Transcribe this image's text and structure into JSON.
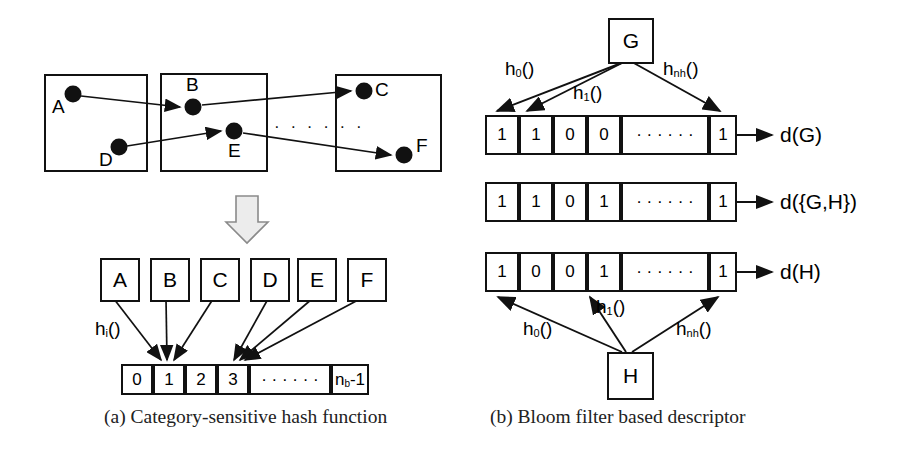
{
  "figure": {
    "panels": [
      {
        "id": "a",
        "caption": "(a) Category-sensitive hash function",
        "groups": [
          {
            "name": "group-1",
            "nodes": [
              "A",
              "D"
            ]
          },
          {
            "name": "group-2",
            "nodes": [
              "B",
              "E"
            ]
          },
          {
            "name": "group-3",
            "nodes": [
              "C",
              "F"
            ]
          }
        ],
        "ellipsis": "· · · · · ·",
        "item_boxes": [
          "A",
          "B",
          "C",
          "D",
          "E",
          "F"
        ],
        "hash_label": "h",
        "hash_sub": "i",
        "hash_suffix": "()",
        "bit_cells": [
          "0",
          "1",
          "2",
          "3",
          "· · · · · ·",
          "n"
        ],
        "last_cell_label": "n",
        "last_cell_sub": "b",
        "last_cell_suffix": "-1",
        "cell_ellipsis": "· · · · · ·",
        "mapping_note": [
          "A→1",
          "B→1",
          "C→1",
          "D→3",
          "E→3",
          "F→3"
        ]
      },
      {
        "id": "b",
        "caption": "(b) Bloom filter based descriptor",
        "source_top": "G",
        "source_bottom": "H",
        "hash_functions_top": [
          {
            "name": "h",
            "sub": "0",
            "suffix": "()"
          },
          {
            "name": "h",
            "sub": "1",
            "suffix": "()"
          },
          {
            "name": "h",
            "sub": "nh",
            "suffix": "()"
          }
        ],
        "hash_functions_bottom": [
          {
            "name": "h",
            "sub": "0",
            "suffix": "()"
          },
          {
            "name": "h",
            "sub": "1",
            "suffix": "()"
          },
          {
            "name": "h",
            "sub": "nh",
            "suffix": "()"
          }
        ],
        "rows": [
          {
            "bits": [
              "1",
              "1",
              "0",
              "0",
              "· · · · · ·",
              "1"
            ],
            "label": "d(G)"
          },
          {
            "bits": [
              "1",
              "1",
              "0",
              "1",
              "· · · · · ·",
              "1"
            ],
            "label": "d({G,H})"
          },
          {
            "bits": [
              "1",
              "0",
              "0",
              "1",
              "· · · · · ·",
              "1"
            ],
            "label": "d(H)"
          }
        ]
      }
    ],
    "colors": {
      "stroke": "#111111",
      "fill": "#ffffff",
      "arrow_block": "#e8e8e8"
    }
  }
}
